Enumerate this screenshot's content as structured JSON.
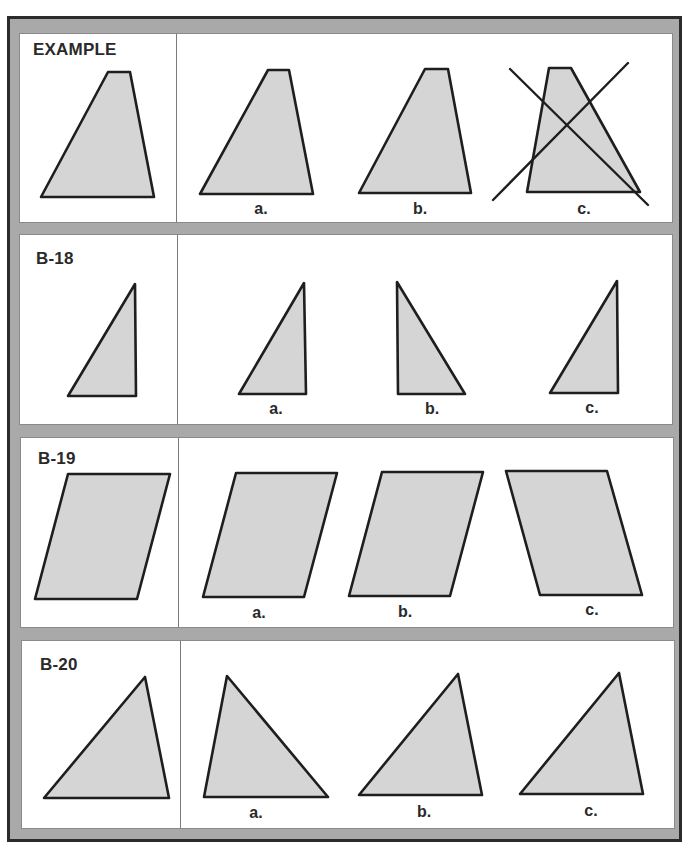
{
  "colors": {
    "frame_gray": "#a9a9a9",
    "frame_border": "#2b2b2b",
    "panel_bg": "#ffffff",
    "shape_fill": "#d5d5d5",
    "shape_stroke": "#1e1e1e"
  },
  "panels": [
    {
      "id": "example",
      "title": "EXAMPLE",
      "box": {
        "top": 33,
        "bottom": 223,
        "left": 19,
        "right": 673,
        "divider_x": 175
      },
      "title_pos": {
        "x": 33,
        "y": 40
      },
      "reference": {
        "points": [
          [
            108,
            72
          ],
          [
            130,
            72
          ],
          [
            154,
            197
          ],
          [
            41,
            197
          ]
        ]
      },
      "options": [
        {
          "label": "a.",
          "label_pos": [
            261,
            214
          ],
          "points": [
            [
              268,
              70
            ],
            [
              289,
              70
            ],
            [
              313,
              194
            ],
            [
              200,
              194
            ]
          ],
          "crossed_out": false
        },
        {
          "label": "b.",
          "label_pos": [
            420,
            214
          ],
          "points": [
            [
              425,
              69
            ],
            [
              448,
              69
            ],
            [
              471,
              193
            ],
            [
              359,
              193
            ]
          ],
          "crossed_out": false
        },
        {
          "label": "c.",
          "label_pos": [
            584,
            214
          ],
          "points": [
            [
              549,
              68
            ],
            [
              571,
              68
            ],
            [
              640,
              192
            ],
            [
              527,
              192
            ]
          ],
          "crossed_out": true,
          "cross_lines": [
            [
              [
                510,
                69
              ],
              [
                648,
                205
              ]
            ],
            [
              [
                493,
                200
              ],
              [
                628,
                63
              ]
            ]
          ]
        }
      ]
    },
    {
      "id": "b-18",
      "title": "B-18",
      "box": {
        "top": 234,
        "bottom": 425,
        "left": 19,
        "right": 673,
        "divider_x": 176
      },
      "title_pos": {
        "x": 36,
        "y": 249
      },
      "reference": {
        "points": [
          [
            135,
            284
          ],
          [
            136,
            396
          ],
          [
            68,
            396
          ]
        ]
      },
      "options": [
        {
          "label": "a.",
          "label_pos": [
            276,
            414
          ],
          "points": [
            [
              304,
              283
            ],
            [
              306,
              394
            ],
            [
              239,
              394
            ]
          ],
          "crossed_out": false
        },
        {
          "label": "b.",
          "label_pos": [
            432,
            414
          ],
          "points": [
            [
              397,
              282
            ],
            [
              398,
              394
            ],
            [
              465,
              394
            ]
          ],
          "crossed_out": false
        },
        {
          "label": "c.",
          "label_pos": [
            592,
            413
          ],
          "points": [
            [
              617,
              281
            ],
            [
              618,
              393
            ],
            [
              550,
              393
            ]
          ],
          "crossed_out": false
        }
      ]
    },
    {
      "id": "b-19",
      "title": "B-19",
      "box": {
        "top": 437,
        "bottom": 628,
        "left": 20,
        "right": 674,
        "divider_x": 177
      },
      "title_pos": {
        "x": 38,
        "y": 449
      },
      "reference": {
        "points": [
          [
            68,
            474
          ],
          [
            170,
            474
          ],
          [
            137,
            599
          ],
          [
            35,
            599
          ]
        ]
      },
      "options": [
        {
          "label": "a.",
          "label_pos": [
            259,
            618
          ],
          "points": [
            [
              236,
              473
            ],
            [
              337,
              473
            ],
            [
              304,
              597
            ],
            [
              203,
              597
            ]
          ],
          "crossed_out": false
        },
        {
          "label": "b.",
          "label_pos": [
            405,
            617
          ],
          "points": [
            [
              382,
              472
            ],
            [
              483,
              472
            ],
            [
              450,
              596
            ],
            [
              349,
              596
            ]
          ],
          "crossed_out": false
        },
        {
          "label": "c.",
          "label_pos": [
            592,
            615
          ],
          "points": [
            [
              506,
              471
            ],
            [
              607,
              471
            ],
            [
              642,
              595
            ],
            [
              540,
              595
            ]
          ],
          "crossed_out": false
        }
      ]
    },
    {
      "id": "b-20",
      "title": "B-20",
      "box": {
        "top": 640,
        "bottom": 829,
        "left": 21,
        "right": 675,
        "divider_x": 179
      },
      "title_pos": {
        "x": 40,
        "y": 655
      },
      "reference": {
        "points": [
          [
            145,
            677
          ],
          [
            169,
            798
          ],
          [
            44,
            798
          ]
        ]
      },
      "options": [
        {
          "label": "a.",
          "label_pos": [
            256,
            818
          ],
          "points": [
            [
              227,
              676
            ],
            [
              328,
              797
            ],
            [
              204,
              797
            ]
          ],
          "crossed_out": false
        },
        {
          "label": "b.",
          "label_pos": [
            424,
            817
          ],
          "points": [
            [
              458,
              674
            ],
            [
              482,
              795
            ],
            [
              359,
              795
            ]
          ],
          "crossed_out": false
        },
        {
          "label": "c.",
          "label_pos": [
            591,
            816
          ],
          "points": [
            [
              619,
              673
            ],
            [
              643,
              794
            ],
            [
              520,
              794
            ]
          ],
          "crossed_out": false
        }
      ]
    }
  ]
}
